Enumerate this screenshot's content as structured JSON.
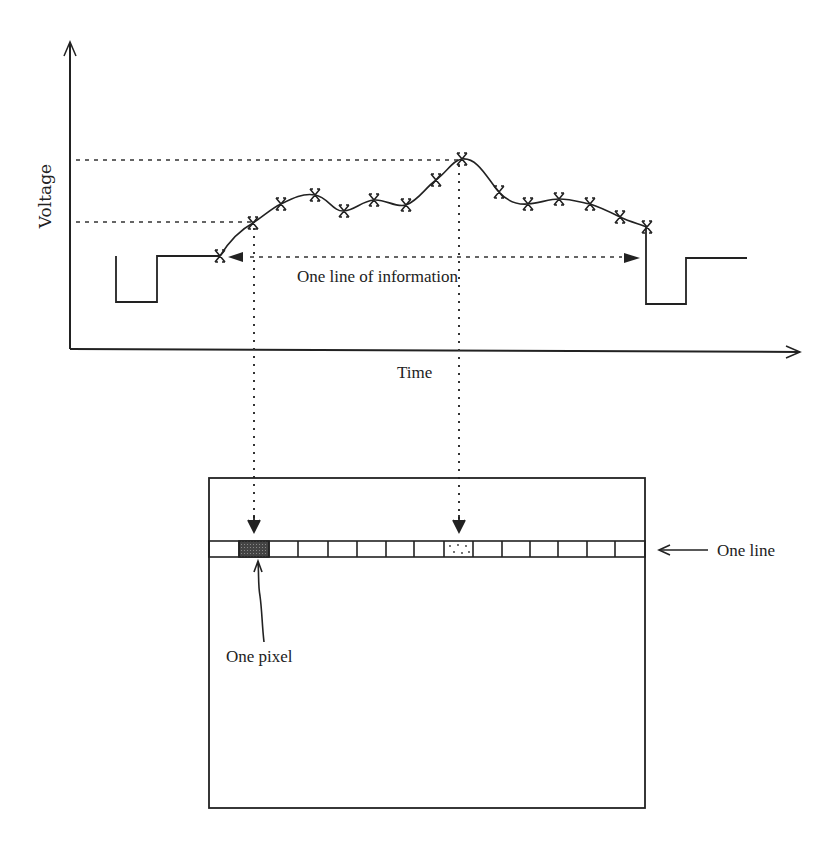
{
  "diagram": {
    "type": "video-signal-to-raster-line",
    "top_plot": {
      "y_axis_label": "Voltage",
      "x_axis_label": "Time",
      "span_label": "One line of information",
      "sample_marker": "X",
      "samples": [
        {
          "x": 220,
          "y": 256
        },
        {
          "x": 253,
          "y": 223
        },
        {
          "x": 281,
          "y": 204
        },
        {
          "x": 315,
          "y": 195
        },
        {
          "x": 344,
          "y": 211
        },
        {
          "x": 374,
          "y": 200
        },
        {
          "x": 406,
          "y": 205
        },
        {
          "x": 436,
          "y": 180
        },
        {
          "x": 462,
          "y": 159
        },
        {
          "x": 499,
          "y": 192
        },
        {
          "x": 528,
          "y": 204
        },
        {
          "x": 559,
          "y": 199
        },
        {
          "x": 590,
          "y": 204
        },
        {
          "x": 620,
          "y": 217
        },
        {
          "x": 647,
          "y": 227
        }
      ],
      "reference_levels": [
        {
          "name": "high-level",
          "y": 159
        },
        {
          "name": "low-level",
          "y": 223
        }
      ]
    },
    "screen": {
      "line_label": "One line",
      "pixel_label": "One pixel",
      "pixel_count": 15,
      "pixels": [
        {
          "fill": "empty"
        },
        {
          "fill": "dark"
        },
        {
          "fill": "empty"
        },
        {
          "fill": "empty"
        },
        {
          "fill": "empty"
        },
        {
          "fill": "empty"
        },
        {
          "fill": "empty"
        },
        {
          "fill": "empty"
        },
        {
          "fill": "dotted"
        },
        {
          "fill": "empty"
        },
        {
          "fill": "empty"
        },
        {
          "fill": "empty"
        },
        {
          "fill": "empty"
        },
        {
          "fill": "empty"
        },
        {
          "fill": "empty"
        }
      ]
    },
    "colors": {
      "ink": "#222222",
      "background": "#ffffff",
      "dark_pixel": "#555555"
    }
  }
}
